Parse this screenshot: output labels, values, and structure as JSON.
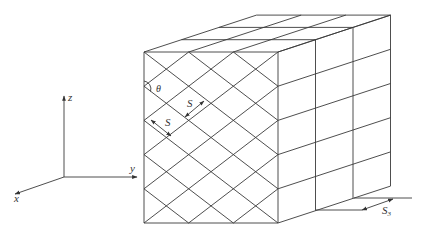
{
  "figure": {
    "width": 421,
    "height": 231,
    "line_color": "#3a3a3a",
    "background": "#ffffff"
  },
  "axes": {
    "origin": [
      64,
      177
    ],
    "labels": {
      "x": "x",
      "y": "y",
      "z": "z"
    }
  },
  "cube": {
    "front_face": {
      "left": 144,
      "right": 278,
      "top": 52,
      "bottom": 223
    },
    "depth_offset_per_layer": [
      37.5,
      -12.3
    ],
    "layers": 3,
    "rows": 5,
    "lattice_columns": 3
  },
  "annotations": {
    "angle_label": "θ",
    "spacing_label_1": "S",
    "spacing_label_2": "S",
    "layer_spacing_label": "S",
    "layer_spacing_subscript": "3"
  }
}
